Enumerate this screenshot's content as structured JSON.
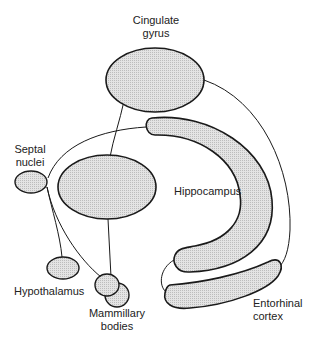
{
  "diagram": {
    "type": "limbic-system-pathway",
    "labels": {
      "cingulate": [
        "Cingulate",
        "gyrus"
      ],
      "septal": [
        "Septal",
        "nuclei"
      ],
      "hippocampus": "Hippocampus",
      "hypothalamus": "Hypothalamus",
      "mammillary": [
        "Mammillary",
        "bodies"
      ],
      "entorhinal": [
        "Entorhinal",
        "cortex"
      ]
    },
    "colors": {
      "fill": "#d6d6d6",
      "stroke": "#1a1a1a",
      "background": "#ffffff"
    }
  }
}
